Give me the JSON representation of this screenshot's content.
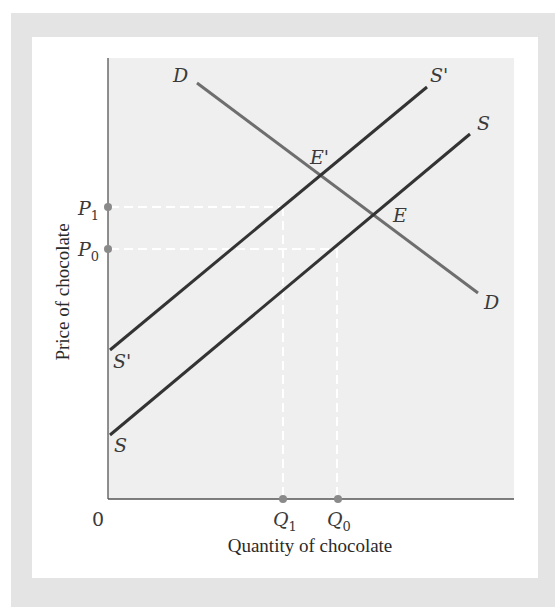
{
  "figure": {
    "y_axis_label": "Price of chocolate",
    "x_axis_label": "Quantity of chocolate",
    "origin_label": "0",
    "price_ticks": [
      {
        "label": "P",
        "sub": "1",
        "y": 207
      },
      {
        "label": "P",
        "sub": "0",
        "y": 249
      }
    ],
    "quantity_ticks": [
      {
        "label": "Q",
        "sub": "1",
        "x": 283
      },
      {
        "label": "Q",
        "sub": "0",
        "x": 338
      }
    ],
    "curves": {
      "demand": {
        "start_label": "D",
        "end_label": "D"
      },
      "supply": {
        "start_label": "S",
        "end_label": "S"
      },
      "supply_shifted": {
        "start_label": "S'",
        "end_label": "S'"
      }
    },
    "points": {
      "original_equilibrium": "E",
      "new_equilibrium": "E'"
    },
    "colors": {
      "frame": "#e4e4e4",
      "plot_bg": "#efefef",
      "supply": "#333333",
      "demand": "#6e6e6e",
      "dots": "#8a8a8a"
    }
  }
}
